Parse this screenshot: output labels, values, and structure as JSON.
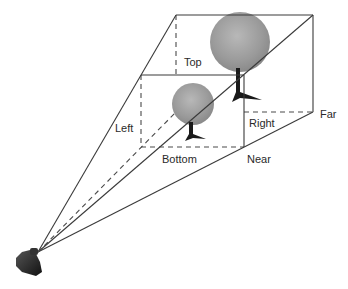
{
  "labels": {
    "top": "Top",
    "left": "Left",
    "right": "Right",
    "bottom": "Bottom",
    "near": "Near",
    "far": "Far"
  },
  "objects": {
    "camera": "camera-icon",
    "near_tree": "tree-icon",
    "far_tree": "tree-icon"
  },
  "colors": {
    "line": "#3a3a3a",
    "foliage": "#9a9a9a",
    "trunk": "#1a1a1a",
    "camera": "#2a2a2a"
  }
}
